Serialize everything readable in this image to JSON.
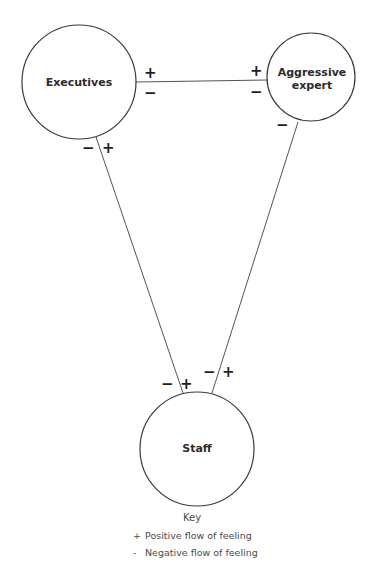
{
  "nodes": {
    "executives": {
      "label": "Executives"
    },
    "aggressive_expert": {
      "label_line1": "Aggressive",
      "label_line2": "expert"
    },
    "staff": {
      "label": "Staff"
    }
  },
  "edges": {
    "executives_aggressive": {
      "exec_end_top": "+",
      "exec_end_bottom": "−",
      "agg_end_top": "+",
      "agg_end_bottom": "−"
    },
    "executives_staff": {
      "exec_end_left": "−",
      "exec_end_right": "+",
      "staff_end_left": "−",
      "staff_end_right": "+"
    },
    "aggressive_staff": {
      "agg_end": "−",
      "staff_end_left": "−",
      "staff_end_right": "+"
    }
  },
  "key": {
    "title": "Key",
    "items": [
      {
        "symbol": "+",
        "label": "Positive flow of feeling"
      },
      {
        "symbol": "-",
        "label": "Negative flow of feeling"
      }
    ]
  },
  "colors": {
    "stroke": "#3a3a3a",
    "text": "#2b2b2b",
    "background": "#ffffff"
  }
}
